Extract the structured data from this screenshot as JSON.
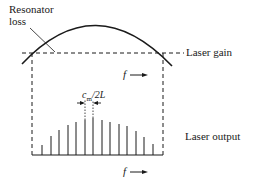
{
  "labels": {
    "resonator_loss_line1": "Resonator",
    "resonator_loss_line2": "loss",
    "laser_gain": "Laser gain",
    "laser_output": "Laser output",
    "mode_spacing": "c",
    "mode_spacing_sub": "m",
    "mode_spacing_rest": "/2L",
    "freq_axis_top": "f",
    "freq_axis_bottom": "f"
  },
  "colors": {
    "ink": "#1a1a1a",
    "background": "#ffffff"
  },
  "gain_curve": {
    "start": [
      22,
      64
    ],
    "peak": [
      95,
      24
    ],
    "end": [
      172,
      66
    ]
  },
  "loss_threshold_y": 53,
  "threshold_crossings_x": [
    32,
    163
  ],
  "output_baseline_y": 155,
  "longitudinal_modes": {
    "x": [
      42,
      51,
      59,
      68,
      76,
      85,
      93,
      102,
      110,
      119,
      127,
      136,
      144,
      153
    ],
    "heights": [
      10,
      19,
      25,
      30,
      33,
      35,
      37,
      35,
      33,
      31,
      29,
      24,
      18,
      11
    ]
  }
}
